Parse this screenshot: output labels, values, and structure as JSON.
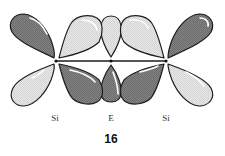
{
  "figure": {
    "number": "16",
    "atoms": [
      {
        "label": "Si",
        "x": 56,
        "y": 61
      },
      {
        "label": "E",
        "x": 111,
        "y": 61
      },
      {
        "label": "Si",
        "x": 166,
        "y": 61
      }
    ],
    "colors": {
      "dark_lobe": "#7d7d7d",
      "light_lobe": "#e2e2e2",
      "stroke": "#1e1e1e",
      "bond": "#1e1e1e",
      "highlight": "#ffffff"
    },
    "lobes": [
      {
        "name": "left-si-upper",
        "phase": "dark"
      },
      {
        "name": "left-si-lower",
        "phase": "light"
      },
      {
        "name": "left-si-inner-upper",
        "phase": "light"
      },
      {
        "name": "left-si-inner-lower",
        "phase": "dark"
      },
      {
        "name": "e-upper",
        "phase": "light"
      },
      {
        "name": "e-lower",
        "phase": "dark"
      },
      {
        "name": "right-si-inner-upper",
        "phase": "light"
      },
      {
        "name": "right-si-inner-lower",
        "phase": "dark"
      },
      {
        "name": "right-si-upper",
        "phase": "dark"
      },
      {
        "name": "right-si-lower",
        "phase": "light"
      }
    ]
  }
}
